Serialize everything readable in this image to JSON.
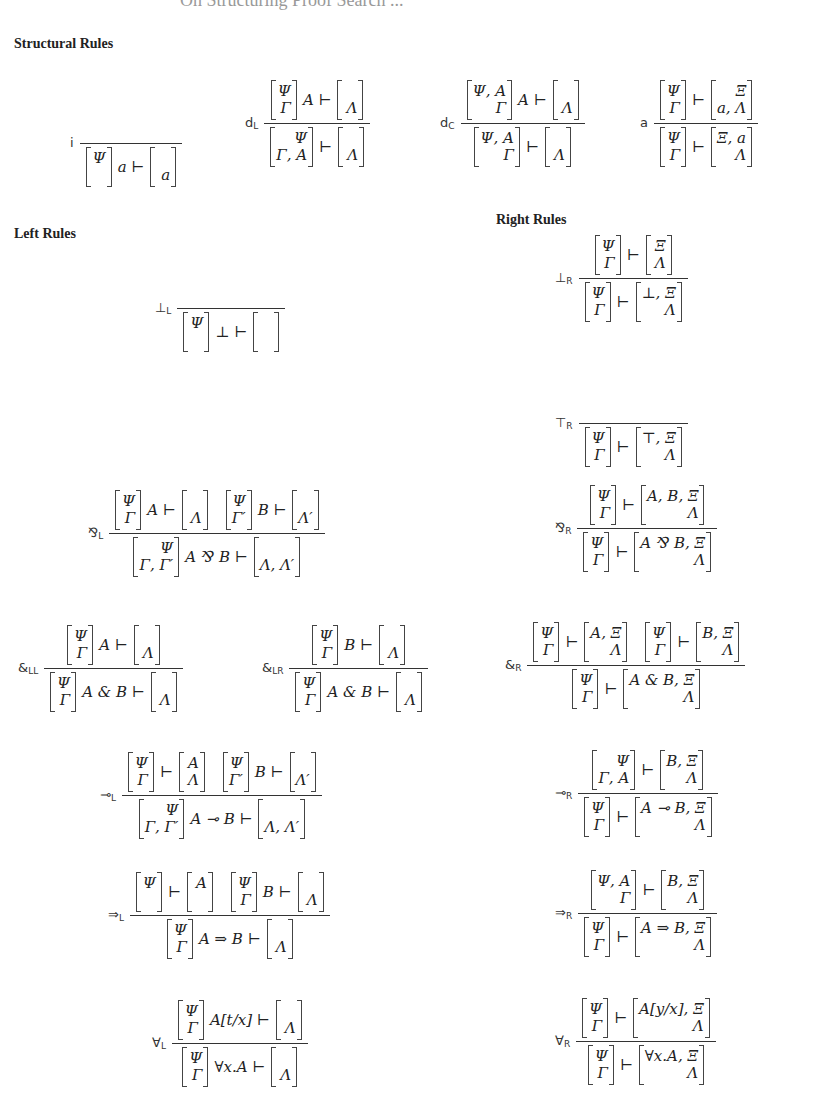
{
  "page": {
    "title": "On Structuring Proof Search ..."
  },
  "sections": {
    "structural": "Structural Rules",
    "left": "Left Rules",
    "right": "Right Rules"
  },
  "rules": {
    "i": {
      "name": "i",
      "sub": "",
      "premises": [],
      "conclusion": {
        "ctx": [
          "Ψ",
          ""
        ],
        "formula": "a",
        "goal": [
          "",
          "a"
        ]
      }
    },
    "dL": {
      "name": "d",
      "sub": "L",
      "premises": [
        {
          "ctx": [
            "Ψ",
            "Γ"
          ],
          "formula": "A",
          "goal": [
            "",
            "Λ"
          ]
        }
      ],
      "conclusion": {
        "ctx": [
          "Ψ",
          "Γ, A"
        ],
        "formula": "",
        "goal": [
          "",
          "Λ"
        ]
      }
    },
    "dC": {
      "name": "d",
      "sub": "C",
      "premises": [
        {
          "ctx": [
            "Ψ, A",
            "Γ"
          ],
          "formula": "A",
          "goal": [
            "",
            "Λ"
          ]
        }
      ],
      "conclusion": {
        "ctx": [
          "Ψ, A",
          "Γ"
        ],
        "formula": "",
        "goal": [
          "",
          "Λ"
        ]
      }
    },
    "a": {
      "name": "a",
      "sub": "",
      "premises": [
        {
          "ctx": [
            "Ψ",
            "Γ"
          ],
          "formula": "",
          "goal": [
            "Ξ",
            "a, Λ"
          ]
        }
      ],
      "conclusion": {
        "ctx": [
          "Ψ",
          "Γ"
        ],
        "formula": "",
        "goal": [
          "Ξ, a",
          "Λ"
        ]
      }
    },
    "botL": {
      "name": "⊥",
      "sub": "L",
      "premises": [],
      "conclusion": {
        "ctx": [
          "Ψ",
          ""
        ],
        "formula": "⊥",
        "goal": [
          "",
          ""
        ]
      }
    },
    "botR": {
      "name": "⊥",
      "sub": "R",
      "premises": [
        {
          "ctx": [
            "Ψ",
            "Γ"
          ],
          "formula": "",
          "goal": [
            "Ξ",
            "Λ"
          ]
        }
      ],
      "conclusion": {
        "ctx": [
          "Ψ",
          "Γ"
        ],
        "formula": "",
        "goal": [
          "⊥, Ξ",
          "Λ"
        ]
      }
    },
    "topR": {
      "name": "⊤",
      "sub": "R",
      "premises": [],
      "conclusion": {
        "ctx": [
          "Ψ",
          "Γ"
        ],
        "formula": "",
        "goal": [
          "⊤, Ξ",
          "Λ"
        ]
      }
    },
    "parL": {
      "name": "⅋",
      "sub": "L",
      "premises": [
        {
          "ctx": [
            "Ψ",
            "Γ"
          ],
          "formula": "A",
          "goal": [
            "",
            "Λ"
          ]
        },
        {
          "ctx": [
            "Ψ",
            "Γ′"
          ],
          "formula": "B",
          "goal": [
            "",
            "Λ′"
          ]
        }
      ],
      "conclusion": {
        "ctx": [
          "Ψ",
          "Γ, Γ′"
        ],
        "formula": "A ⅋ B",
        "goal": [
          "",
          "Λ, Λ′"
        ]
      }
    },
    "parR": {
      "name": "⅋",
      "sub": "R",
      "premises": [
        {
          "ctx": [
            "Ψ",
            "Γ"
          ],
          "formula": "",
          "goal": [
            "A, B, Ξ",
            "Λ"
          ]
        }
      ],
      "conclusion": {
        "ctx": [
          "Ψ",
          "Γ"
        ],
        "formula": "",
        "goal": [
          "A ⅋ B, Ξ",
          "Λ"
        ]
      }
    },
    "withLL": {
      "name": "&",
      "sub": "LL",
      "premises": [
        {
          "ctx": [
            "Ψ",
            "Γ"
          ],
          "formula": "A",
          "goal": [
            "",
            "Λ"
          ]
        }
      ],
      "conclusion": {
        "ctx": [
          "Ψ",
          "Γ"
        ],
        "formula": "A & B",
        "goal": [
          "",
          "Λ"
        ]
      }
    },
    "withLR": {
      "name": "&",
      "sub": "LR",
      "premises": [
        {
          "ctx": [
            "Ψ",
            "Γ"
          ],
          "formula": "B",
          "goal": [
            "",
            "Λ"
          ]
        }
      ],
      "conclusion": {
        "ctx": [
          "Ψ",
          "Γ"
        ],
        "formula": "A & B",
        "goal": [
          "",
          "Λ"
        ]
      }
    },
    "withR": {
      "name": "&",
      "sub": "R",
      "premises": [
        {
          "ctx": [
            "Ψ",
            "Γ"
          ],
          "formula": "",
          "goal": [
            "A, Ξ",
            "Λ"
          ]
        },
        {
          "ctx": [
            "Ψ",
            "Γ"
          ],
          "formula": "",
          "goal": [
            "B, Ξ",
            "Λ"
          ]
        }
      ],
      "conclusion": {
        "ctx": [
          "Ψ",
          "Γ"
        ],
        "formula": "",
        "goal": [
          "A & B, Ξ",
          "Λ"
        ]
      }
    },
    "lolliL": {
      "name": "⊸",
      "sub": "L",
      "premises": [
        {
          "ctx": [
            "Ψ",
            "Γ"
          ],
          "formula": "",
          "goal": [
            "A",
            "Λ"
          ]
        },
        {
          "ctx": [
            "Ψ",
            "Γ′"
          ],
          "formula": "B",
          "goal": [
            "",
            "Λ′"
          ]
        }
      ],
      "conclusion": {
        "ctx": [
          "Ψ",
          "Γ, Γ′"
        ],
        "formula": "A ⊸ B",
        "goal": [
          "",
          "Λ, Λ′"
        ]
      }
    },
    "lolliR": {
      "name": "⊸",
      "sub": "R",
      "premises": [
        {
          "ctx": [
            "Ψ",
            "Γ, A"
          ],
          "formula": "",
          "goal": [
            "B, Ξ",
            "Λ"
          ]
        }
      ],
      "conclusion": {
        "ctx": [
          "Ψ",
          "Γ"
        ],
        "formula": "",
        "goal": [
          "A ⊸ B, Ξ",
          "Λ"
        ]
      }
    },
    "impL": {
      "name": "⇒",
      "sub": "L",
      "premises": [
        {
          "ctx": [
            "Ψ",
            ""
          ],
          "formula": "",
          "goal": [
            "A",
            ""
          ]
        },
        {
          "ctx": [
            "Ψ",
            "Γ"
          ],
          "formula": "B",
          "goal": [
            "",
            "Λ"
          ]
        }
      ],
      "conclusion": {
        "ctx": [
          "Ψ",
          "Γ"
        ],
        "formula": "A ⇒ B",
        "goal": [
          "",
          "Λ"
        ]
      }
    },
    "impR": {
      "name": "⇒",
      "sub": "R",
      "premises": [
        {
          "ctx": [
            "Ψ, A",
            "Γ"
          ],
          "formula": "",
          "goal": [
            "B, Ξ",
            "Λ"
          ]
        }
      ],
      "conclusion": {
        "ctx": [
          "Ψ",
          "Γ"
        ],
        "formula": "",
        "goal": [
          "A ⇒ B, Ξ",
          "Λ"
        ]
      }
    },
    "allL": {
      "name": "∀",
      "sub": "L",
      "premises": [
        {
          "ctx": [
            "Ψ",
            "Γ"
          ],
          "formula": "A[t/x]",
          "goal": [
            "",
            "Λ"
          ]
        }
      ],
      "conclusion": {
        "ctx": [
          "Ψ",
          "Γ"
        ],
        "formula": "∀x.A",
        "goal": [
          "",
          "Λ"
        ]
      }
    },
    "allR": {
      "name": "∀",
      "sub": "R",
      "premises": [
        {
          "ctx": [
            "Ψ",
            "Γ"
          ],
          "formula": "",
          "goal": [
            "A[y/x], Ξ",
            "Λ"
          ]
        }
      ],
      "conclusion": {
        "ctx": [
          "Ψ",
          "Γ"
        ],
        "formula": "",
        "goal": [
          "∀x.A, Ξ",
          "Λ"
        ]
      }
    }
  },
  "layout": {
    "i": [
      70,
      130
    ],
    "dL": [
      245,
      80
    ],
    "dC": [
      440,
      80
    ],
    "a": [
      640,
      80
    ],
    "botL": [
      155,
      295
    ],
    "botR": [
      555,
      235
    ],
    "topR": [
      555,
      410
    ],
    "parL": [
      88,
      490
    ],
    "parR": [
      555,
      485
    ],
    "withLL": [
      18,
      625
    ],
    "withLR": [
      262,
      625
    ],
    "withR": [
      505,
      622
    ],
    "lolliL": [
      100,
      752
    ],
    "lolliR": [
      555,
      750
    ],
    "impL": [
      108,
      872
    ],
    "impR": [
      555,
      870
    ],
    "allL": [
      152,
      1000
    ],
    "allR": [
      555,
      998
    ]
  },
  "turnstile": "⊢"
}
